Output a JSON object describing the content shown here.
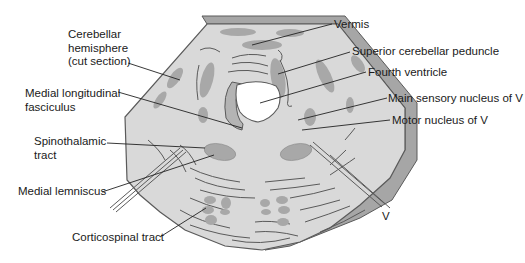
{
  "colors": {
    "background": "#ffffff",
    "tissue_fill": "#d9d9d9",
    "cut_edge_fill": "#a6a6a6",
    "nucleus_fill": "#a8a8a8",
    "outline": "#5a5a5a",
    "ventricle_fill": "#ffffff",
    "leader_line": "#222222",
    "text": "#1a1a1a"
  },
  "labels": {
    "left": [
      {
        "id": "cerebellar-hemisphere",
        "text": "Cerebellar\nhemisphere\n(cut section)"
      },
      {
        "id": "medial-longitudinal-fasciculus",
        "text": "Medial longitudinal\nfasciculus"
      },
      {
        "id": "spinothalamic-tract",
        "text": "Spinothalamic\ntract"
      },
      {
        "id": "medial-lemniscus",
        "text": "Medial lemniscus"
      },
      {
        "id": "corticospinal-tract",
        "text": "Corticospinal tract"
      }
    ],
    "right": [
      {
        "id": "vermis",
        "text": "Vermis"
      },
      {
        "id": "superior-cerebellar-peduncle",
        "text": "Superior cerebellar peduncle"
      },
      {
        "id": "fourth-ventricle",
        "text": "Fourth ventricle"
      },
      {
        "id": "main-sensory-nucleus",
        "text": "Main sensory nucleus of V"
      },
      {
        "id": "motor-nucleus",
        "text": "Motor nucleus of V"
      },
      {
        "id": "trigeminal-nerve",
        "text": "V"
      }
    ]
  }
}
